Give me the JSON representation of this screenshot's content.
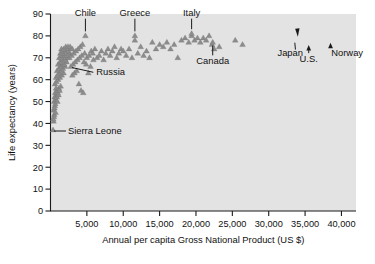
{
  "chart_data": {
    "type": "scatter",
    "title": "",
    "xlabel": "Annual per capita Gross National Product (US $)",
    "ylabel": "Life expectancy (years)",
    "xlim": [
      0,
      42000
    ],
    "ylim": [
      0,
      90
    ],
    "xticks": [
      5000,
      10000,
      15000,
      20000,
      25000,
      30000,
      35000,
      40000
    ],
    "xtick_labels": [
      "5,000",
      "10,000",
      "15,000",
      "20,000",
      "25,000",
      "30,000",
      "35,000",
      "40,000"
    ],
    "yticks": [
      0,
      10,
      20,
      30,
      40,
      50,
      60,
      70,
      80,
      90
    ],
    "ytick_labels": [
      "0",
      "10",
      "20",
      "30",
      "40",
      "50",
      "60",
      "70",
      "80",
      "90"
    ],
    "grid": false,
    "legend": null,
    "marker": "triangle",
    "marker_color": "#8c8c8c",
    "panel_color": "#e3e3e3",
    "points": [
      [
        350,
        37
      ],
      [
        420,
        41
      ],
      [
        520,
        44
      ],
      [
        430,
        46
      ],
      [
        600,
        48
      ],
      [
        500,
        50
      ],
      [
        700,
        51
      ],
      [
        560,
        52
      ],
      [
        820,
        53
      ],
      [
        640,
        54
      ],
      [
        900,
        55
      ],
      [
        760,
        56
      ],
      [
        480,
        43
      ],
      [
        540,
        47
      ],
      [
        660,
        49
      ],
      [
        880,
        52
      ],
      [
        1000,
        54
      ],
      [
        1150,
        56
      ],
      [
        380,
        42
      ],
      [
        700,
        45
      ],
      [
        950,
        50
      ],
      [
        1100,
        53
      ],
      [
        1250,
        55
      ],
      [
        1400,
        57
      ],
      [
        620,
        58
      ],
      [
        820,
        59
      ],
      [
        1050,
        60
      ],
      [
        1300,
        61
      ],
      [
        1550,
        62
      ],
      [
        1800,
        63
      ],
      [
        760,
        61
      ],
      [
        980,
        62
      ],
      [
        1200,
        63
      ],
      [
        1450,
        64
      ],
      [
        1700,
        65
      ],
      [
        2000,
        66
      ],
      [
        900,
        64
      ],
      [
        1150,
        65
      ],
      [
        1380,
        66
      ],
      [
        1620,
        67
      ],
      [
        1900,
        67
      ],
      [
        2200,
        68
      ],
      [
        1050,
        67
      ],
      [
        1300,
        68
      ],
      [
        1500,
        68
      ],
      [
        1750,
        69
      ],
      [
        2050,
        69
      ],
      [
        2350,
        70
      ],
      [
        1200,
        70
      ],
      [
        1450,
        70
      ],
      [
        1700,
        71
      ],
      [
        1950,
        71
      ],
      [
        2250,
        71
      ],
      [
        2550,
        72
      ],
      [
        1350,
        72
      ],
      [
        1600,
        72
      ],
      [
        1850,
        73
      ],
      [
        2150,
        73
      ],
      [
        2450,
        73
      ],
      [
        2750,
        74
      ],
      [
        1500,
        74
      ],
      [
        1800,
        74
      ],
      [
        2100,
        75
      ],
      [
        2400,
        75
      ],
      [
        2700,
        75
      ],
      [
        3000,
        74
      ],
      [
        2600,
        70
      ],
      [
        2900,
        71
      ],
      [
        3200,
        72
      ],
      [
        3500,
        73
      ],
      [
        3800,
        74
      ],
      [
        4100,
        75
      ],
      [
        2800,
        66
      ],
      [
        3100,
        67
      ],
      [
        3400,
        68
      ],
      [
        3700,
        69
      ],
      [
        4000,
        70
      ],
      [
        4300,
        71
      ],
      [
        3000,
        62
      ],
      [
        3300,
        63
      ],
      [
        3600,
        64
      ],
      [
        3900,
        58
      ],
      [
        4200,
        55
      ],
      [
        4500,
        54
      ],
      [
        4400,
        76
      ],
      [
        4700,
        72
      ],
      [
        5000,
        70
      ],
      [
        5300,
        71
      ],
      [
        5600,
        73
      ],
      [
        5900,
        69
      ],
      [
        4600,
        68
      ],
      [
        4900,
        67
      ],
      [
        5200,
        63
      ],
      [
        5500,
        66
      ],
      [
        5800,
        72
      ],
      [
        6100,
        74
      ],
      [
        6400,
        70
      ],
      [
        6700,
        71
      ],
      [
        7000,
        73
      ],
      [
        7300,
        69
      ],
      [
        7600,
        72
      ],
      [
        7900,
        74
      ],
      [
        8200,
        71
      ],
      [
        8500,
        73
      ],
      [
        8800,
        75
      ],
      [
        9100,
        70
      ],
      [
        9400,
        72
      ],
      [
        9700,
        74
      ],
      [
        10000,
        73
      ],
      [
        10400,
        71
      ],
      [
        10800,
        74
      ],
      [
        11200,
        70
      ],
      [
        11600,
        78
      ],
      [
        12000,
        72
      ],
      [
        12400,
        75
      ],
      [
        12800,
        71
      ],
      [
        13200,
        73
      ],
      [
        13600,
        70
      ],
      [
        14000,
        77
      ],
      [
        14500,
        74
      ],
      [
        15000,
        76
      ],
      [
        15500,
        75
      ],
      [
        16000,
        77
      ],
      [
        16500,
        74
      ],
      [
        17000,
        76
      ],
      [
        17500,
        70
      ],
      [
        18000,
        78
      ],
      [
        18500,
        79
      ],
      [
        19000,
        77
      ],
      [
        19400,
        80
      ],
      [
        19800,
        78
      ],
      [
        20200,
        79
      ],
      [
        20600,
        77
      ],
      [
        21000,
        79
      ],
      [
        21400,
        78
      ],
      [
        21800,
        80
      ],
      [
        22200,
        76
      ],
      [
        22500,
        74
      ],
      [
        23200,
        75
      ],
      [
        25400,
        78
      ],
      [
        26400,
        76
      ],
      [
        4800,
        80
      ],
      [
        11600,
        80
      ],
      [
        19400,
        81
      ],
      [
        22300,
        77
      ]
    ],
    "annotations": [
      {
        "label": "Chile",
        "x": 4800,
        "y": 80,
        "leader": "vertical-down",
        "label_x": 4600,
        "label_y": 89
      },
      {
        "label": "Greece",
        "x": 11600,
        "y": 80,
        "leader": "vertical-down",
        "label_x": 11500,
        "label_y": 89
      },
      {
        "label": "Italy",
        "x": 19400,
        "y": 81,
        "leader": "vertical-down",
        "label_x": 19200,
        "label_y": 89
      },
      {
        "label": "Canada",
        "x": 22300,
        "y": 77,
        "leader": "vertical-up",
        "label_x": 22300,
        "label_y": 67
      },
      {
        "label": "Russia",
        "x": 2750,
        "y": 66,
        "leader": "diagonal",
        "label_x": 6300,
        "label_y": 62
      },
      {
        "label": "Sierra Leone",
        "x": 350,
        "y": 37,
        "leader": "horizontal",
        "label_x": 2400,
        "label_y": 37
      },
      {
        "label": "Japan",
        "x": 34000,
        "y": 81,
        "leader": "diagonal-arrow",
        "label_x": 31200,
        "label_y": 71
      },
      {
        "label": "U.S.",
        "x": 35500,
        "y": 77,
        "leader": "vertical-arrow",
        "label_x": 35500,
        "label_y": 68
      },
      {
        "label": "Norway",
        "x": 38500,
        "y": 78,
        "leader": "vertical-arrow",
        "label_x": 38600,
        "label_y": 71
      }
    ]
  }
}
